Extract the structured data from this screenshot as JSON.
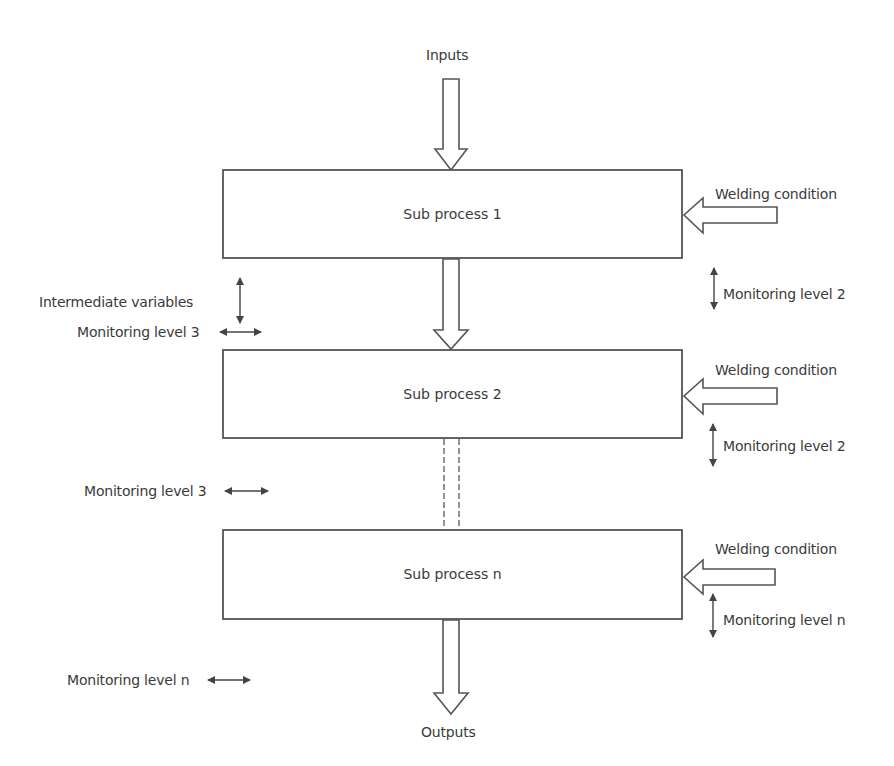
{
  "diagram": {
    "inputs_label": "Inputs",
    "outputs_label": "Outputs",
    "subprocesses": [
      {
        "label": "Sub process 1",
        "welding_label": "Welding condition",
        "monitor_right": "Monitoring level 2"
      },
      {
        "label": "Sub process 2",
        "welding_label": "Welding condition",
        "monitor_right": "Monitoring level 2"
      },
      {
        "label": "Sub process n",
        "welding_label": "Welding condition",
        "monitor_right": "Monitoring level n"
      }
    ],
    "left_labels": {
      "intermediate": "Intermediate variables",
      "monitor_1": "Monitoring level 3",
      "monitor_2": "Monitoring level 3",
      "monitor_3": "Monitoring level n"
    },
    "colors": {
      "stroke": "#555555",
      "text": "#3a3a3a",
      "background": "#ffffff"
    }
  }
}
